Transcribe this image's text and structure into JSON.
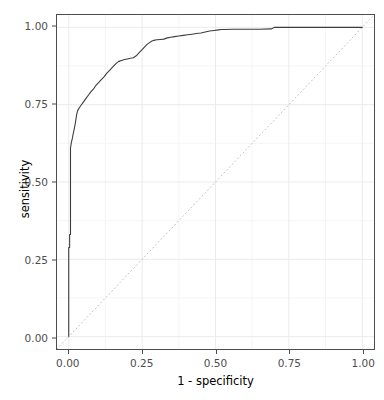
{
  "chart_data": {
    "type": "line",
    "title": "",
    "xlabel": "1 - specificity",
    "ylabel": "sensitivity",
    "xlim": [
      -0.04,
      1.04
    ],
    "ylim": [
      -0.04,
      1.04
    ],
    "grid": true,
    "legend": null,
    "xticks": [
      "0.00",
      "0.25",
      "0.50",
      "0.75",
      "1.00"
    ],
    "xtick_values": [
      0.0,
      0.25,
      0.5,
      0.75,
      1.0
    ],
    "yticks": [
      "0.00",
      "0.25",
      "0.50",
      "0.75",
      "1.00"
    ],
    "ytick_values": [
      0.0,
      0.25,
      0.5,
      0.75,
      1.0
    ],
    "minor_gridlines_x": [
      0.125,
      0.375,
      0.625,
      0.875
    ],
    "minor_gridlines_y": [
      0.125,
      0.375,
      0.625,
      0.875
    ],
    "series": [
      {
        "name": "ROC curve",
        "style": "solid",
        "color": "#3d3d3d",
        "width": 1.1,
        "points": [
          [
            0.0,
            0.0
          ],
          [
            0.0,
            0.288
          ],
          [
            0.003,
            0.288
          ],
          [
            0.003,
            0.33
          ],
          [
            0.006,
            0.33
          ],
          [
            0.006,
            0.52
          ],
          [
            0.006,
            0.61
          ],
          [
            0.009,
            0.628
          ],
          [
            0.012,
            0.64
          ],
          [
            0.015,
            0.655
          ],
          [
            0.018,
            0.668
          ],
          [
            0.021,
            0.682
          ],
          [
            0.024,
            0.7
          ],
          [
            0.027,
            0.718
          ],
          [
            0.03,
            0.73
          ],
          [
            0.036,
            0.74
          ],
          [
            0.042,
            0.748
          ],
          [
            0.048,
            0.756
          ],
          [
            0.054,
            0.764
          ],
          [
            0.06,
            0.772
          ],
          [
            0.068,
            0.782
          ],
          [
            0.076,
            0.792
          ],
          [
            0.084,
            0.8
          ],
          [
            0.092,
            0.812
          ],
          [
            0.1,
            0.82
          ],
          [
            0.11,
            0.83
          ],
          [
            0.12,
            0.84
          ],
          [
            0.13,
            0.852
          ],
          [
            0.14,
            0.862
          ],
          [
            0.15,
            0.872
          ],
          [
            0.16,
            0.882
          ],
          [
            0.17,
            0.89
          ],
          [
            0.18,
            0.893
          ],
          [
            0.19,
            0.896
          ],
          [
            0.2,
            0.898
          ],
          [
            0.21,
            0.9
          ],
          [
            0.22,
            0.902
          ],
          [
            0.23,
            0.908
          ],
          [
            0.24,
            0.918
          ],
          [
            0.25,
            0.928
          ],
          [
            0.258,
            0.936
          ],
          [
            0.266,
            0.944
          ],
          [
            0.274,
            0.95
          ],
          [
            0.282,
            0.955
          ],
          [
            0.29,
            0.958
          ],
          [
            0.3,
            0.96
          ],
          [
            0.312,
            0.961
          ],
          [
            0.324,
            0.962
          ],
          [
            0.336,
            0.966
          ],
          [
            0.348,
            0.968
          ],
          [
            0.36,
            0.97
          ],
          [
            0.375,
            0.972
          ],
          [
            0.39,
            0.974
          ],
          [
            0.405,
            0.976
          ],
          [
            0.42,
            0.978
          ],
          [
            0.435,
            0.98
          ],
          [
            0.45,
            0.982
          ],
          [
            0.465,
            0.985
          ],
          [
            0.48,
            0.988
          ],
          [
            0.495,
            0.99
          ],
          [
            0.51,
            0.992
          ],
          [
            0.52,
            0.993
          ],
          [
            0.53,
            0.993
          ],
          [
            0.56,
            0.994
          ],
          [
            0.6,
            0.994
          ],
          [
            0.65,
            0.994
          ],
          [
            0.69,
            0.995
          ],
          [
            0.7,
            1.0
          ],
          [
            0.8,
            1.0
          ],
          [
            0.9,
            1.0
          ],
          [
            1.0,
            1.0
          ]
        ]
      },
      {
        "name": "chance diagonal",
        "style": "dotted",
        "color": "#bfbfbf",
        "width": 1.0,
        "points": [
          [
            -0.04,
            -0.04
          ],
          [
            1.04,
            1.04
          ]
        ]
      }
    ]
  },
  "axes": {
    "x_title": "1 - specificity",
    "y_title": "sensitivity"
  },
  "caption": {
    "text": ""
  },
  "colors": {
    "panel_background": "#ffffff",
    "panel_border": "#4d4d4d",
    "major_gridline": "#ebebeb",
    "minor_gridline": "#f5f5f5",
    "curve": "#3d3d3d",
    "diagonal": "#bfbfbf",
    "tick_text": "#4d4d4d",
    "axis_title": "#000000"
  }
}
